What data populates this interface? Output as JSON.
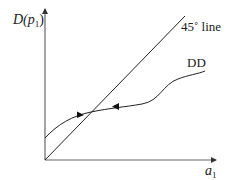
{
  "diagram": {
    "type": "economics-fixed-point-diagram",
    "y_axis": {
      "label_main": "D(",
      "label_var": "p",
      "label_sub": "1",
      "label_close": ")"
    },
    "x_axis": {
      "label_var": "a",
      "label_sub": "1"
    },
    "lines": [
      {
        "name": "45-degree line",
        "label": "45˚ line",
        "from": [
          45,
          160
        ],
        "to": [
          185,
          16
        ]
      },
      {
        "name": "DD curve",
        "label": "DD",
        "shape": "S-shaped, intercept above origin, crosses 45° line once"
      }
    ],
    "arrows_on_curve": [
      {
        "position": "left of intersection",
        "direction": "right (toward intersection)"
      },
      {
        "position": "right of intersection",
        "direction": "left (toward intersection)"
      }
    ],
    "colors": {
      "axis": "#555555",
      "line": "#222222",
      "text": "#222222"
    }
  }
}
